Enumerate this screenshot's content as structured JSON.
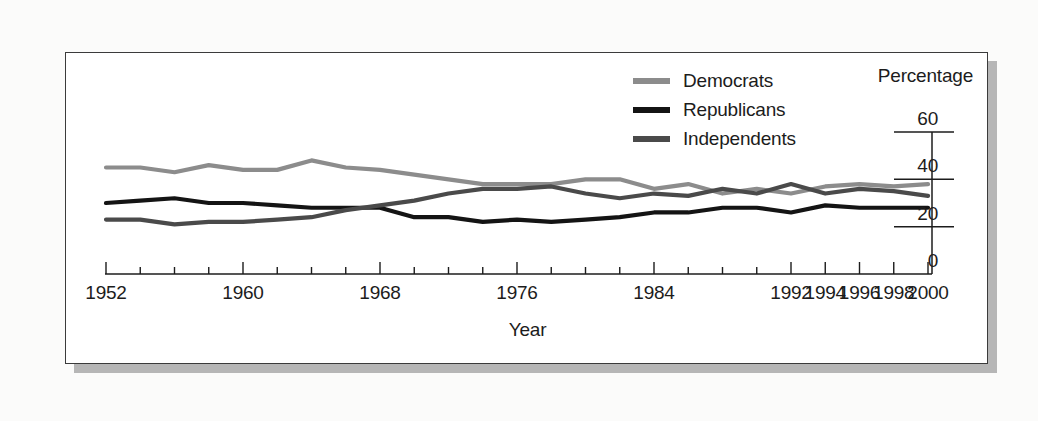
{
  "figure": {
    "x_axis_title": "Year",
    "y_axis_title": "Percentage"
  },
  "legend": {
    "items": [
      {
        "label": "Democrats",
        "color": "#8c8c8c",
        "swatch_name": "legend-swatch-democrats"
      },
      {
        "label": "Republicans",
        "color": "#141414",
        "swatch_name": "legend-swatch-republicans"
      },
      {
        "label": "Independents",
        "color": "#4a4a4a",
        "swatch_name": "legend-swatch-independents"
      }
    ]
  },
  "axes": {
    "y_ticks": [
      "0",
      "20",
      "40",
      "60"
    ],
    "x_ticks": [
      "1952",
      "1960",
      "1968",
      "1976",
      "1984",
      "1992",
      "1994",
      "1996",
      "1998",
      "2000"
    ]
  },
  "chart_data": {
    "type": "line",
    "title": "",
    "subtitle": "",
    "xlabel": "Year",
    "ylabel": "Percentage",
    "xlim": [
      1952,
      2000
    ],
    "ylim": [
      0,
      60
    ],
    "grid": false,
    "legend_position": "top-center",
    "x_tick_labels": [
      "1952",
      "1960",
      "1968",
      "1976",
      "1984",
      "1992",
      "1994",
      "1996",
      "1998",
      "2000"
    ],
    "y_tick_labels": [
      "0",
      "20",
      "40",
      "60"
    ],
    "note": "X tick labels as printed on the source figure: eight-year steps through 1992, then two-year steps to 2000.",
    "x": [
      1952,
      1954,
      1956,
      1958,
      1960,
      1962,
      1964,
      1966,
      1968,
      1970,
      1972,
      1974,
      1976,
      1978,
      1980,
      1982,
      1984,
      1986,
      1988,
      1990,
      1992,
      1994,
      1996,
      1998,
      2000
    ],
    "series": [
      {
        "name": "Democrats",
        "color": "#8c8c8c",
        "values": [
          45,
          45,
          43,
          46,
          44,
          44,
          48,
          45,
          44,
          42,
          40,
          38,
          38,
          38,
          40,
          40,
          36,
          38,
          34,
          36,
          34,
          37,
          38,
          37,
          38
        ]
      },
      {
        "name": "Republicans",
        "color": "#141414",
        "values": [
          30,
          31,
          32,
          30,
          30,
          29,
          28,
          28,
          28,
          24,
          24,
          22,
          23,
          22,
          23,
          24,
          26,
          26,
          28,
          28,
          26,
          29,
          28,
          28,
          28
        ]
      },
      {
        "name": "Independents",
        "color": "#4a4a4a",
        "values": [
          23,
          23,
          21,
          22,
          22,
          23,
          24,
          27,
          29,
          31,
          34,
          36,
          36,
          37,
          34,
          32,
          34,
          33,
          36,
          34,
          38,
          34,
          36,
          35,
          33
        ]
      }
    ]
  }
}
